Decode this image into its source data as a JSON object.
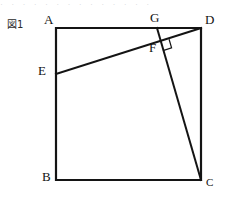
{
  "figure": {
    "caption": "図1",
    "caption_reading": "Figure 1",
    "scan_artifact_text": "· ·  · ·  · · ·  · · · ·  · ·   ·",
    "background_color": "#ffffff",
    "stroke_color": "#141414",
    "stroke_width_square": 2.2,
    "stroke_width_segment": 2.0,
    "stroke_width_angle_mark": 1.2
  },
  "labels": {
    "a": "A",
    "b": "B",
    "c": "C",
    "d": "D",
    "e": "E",
    "f": "F",
    "g": "G"
  },
  "geometry": {
    "shape": "square",
    "vertices": {
      "A": {
        "x": 56,
        "y": 28
      },
      "B": {
        "x": 56,
        "y": 180
      },
      "C": {
        "x": 201,
        "y": 180
      },
      "D": {
        "x": 201,
        "y": 28
      },
      "E": {
        "x": 56,
        "y": 74
      },
      "F": {
        "x": 160.5,
        "y": 42
      },
      "G": {
        "x": 157,
        "y": 28
      }
    },
    "square_edges": [
      {
        "name": "AD",
        "from": "A",
        "to": "D"
      },
      {
        "name": "DC",
        "from": "D",
        "to": "C"
      },
      {
        "name": "CB",
        "from": "C",
        "to": "B"
      },
      {
        "name": "BA",
        "from": "B",
        "to": "A"
      }
    ],
    "segments": [
      {
        "name": "ED",
        "from": "E",
        "to": "D"
      },
      {
        "name": "GC",
        "from": "G",
        "to": "C"
      }
    ],
    "right_angle": {
      "at": "F",
      "between": [
        "ED",
        "GC"
      ],
      "marker_size": 9
    }
  },
  "label_positions": {
    "caption": {
      "x": 7,
      "y": 20
    },
    "A": {
      "x": 44,
      "y": 14
    },
    "B": {
      "x": 42,
      "y": 170
    },
    "C": {
      "x": 205,
      "y": 176
    },
    "D": {
      "x": 204,
      "y": 14
    },
    "E": {
      "x": 38,
      "y": 64
    },
    "F": {
      "x": 150,
      "y": 44
    },
    "G": {
      "x": 150,
      "y": 12
    }
  }
}
